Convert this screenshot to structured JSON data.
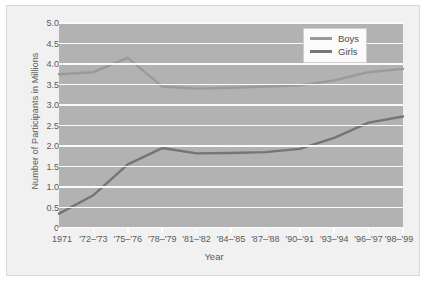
{
  "chart_data": {
    "type": "line",
    "title": "",
    "xlabel": "Year",
    "ylabel": "Number of Participants in Millions",
    "categories": [
      "1971",
      "'72–'73",
      "'75–'76",
      "'78–'79",
      "'81–'82",
      "'84–'85",
      "'87–'88",
      "'90–'91",
      "'93–'94",
      "'96–'97",
      "'98–'99"
    ],
    "series": [
      {
        "name": "Boys",
        "color": "#9a9a9a",
        "values": [
          3.75,
          3.8,
          4.15,
          3.45,
          3.4,
          3.42,
          3.45,
          3.48,
          3.6,
          3.8,
          3.88
        ]
      },
      {
        "name": "Girls",
        "color": "#757575",
        "values": [
          0.35,
          0.8,
          1.55,
          1.95,
          1.82,
          1.83,
          1.85,
          1.93,
          2.2,
          2.57,
          2.72
        ]
      }
    ],
    "ylim": [
      0,
      5
    ],
    "xlim": [
      0,
      10
    ],
    "yticks": [
      "0",
      "0.5",
      "1.0",
      "1.5",
      "2.0",
      "2.5",
      "3.0",
      "3.5",
      "4.0",
      "4.5",
      "5.0"
    ],
    "ytick_values": [
      0,
      0.5,
      1,
      1.5,
      2,
      2.5,
      3,
      3.5,
      4,
      4.5,
      5
    ],
    "grid": "horizontal",
    "legend_position": "top-right",
    "plot_bgcolor": "#b2b2b2",
    "gridline_color": "#fafafa",
    "figure_bgcolor": "#f1f1f1"
  },
  "legend": {
    "entries": [
      {
        "label": "Boys",
        "color": "#9a9a9a"
      },
      {
        "label": "Girls",
        "color": "#757575"
      }
    ]
  }
}
